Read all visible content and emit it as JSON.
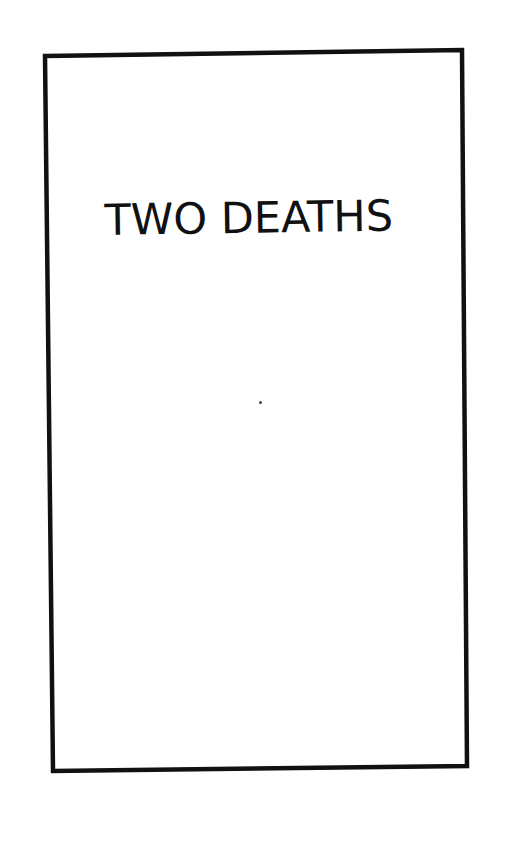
{
  "page": {
    "title": "TWO DEATHS",
    "background_color": "#ffffff",
    "frame_color": "#111111",
    "text_color": "#111111"
  }
}
